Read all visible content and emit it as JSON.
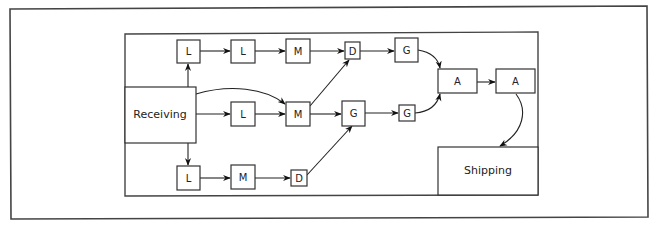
{
  "diagram": {
    "title": "",
    "nodes": [
      {
        "id": "receiving",
        "label": "Receiving"
      },
      {
        "id": "shipping",
        "label": "Shipping"
      },
      {
        "id": "l1",
        "label": "L"
      },
      {
        "id": "l2",
        "label": "L"
      },
      {
        "id": "m1",
        "label": "M"
      },
      {
        "id": "d1",
        "label": "D"
      },
      {
        "id": "g1",
        "label": "G"
      },
      {
        "id": "l3",
        "label": "L"
      },
      {
        "id": "m2",
        "label": "M"
      },
      {
        "id": "g2",
        "label": "G"
      },
      {
        "id": "g3",
        "label": "G"
      },
      {
        "id": "l4",
        "label": "L"
      },
      {
        "id": "m3",
        "label": "M"
      },
      {
        "id": "d2",
        "label": "D"
      },
      {
        "id": "a1",
        "label": "A"
      },
      {
        "id": "a2",
        "label": "A"
      }
    ],
    "edges": [
      {
        "from": "receiving",
        "to": "l1"
      },
      {
        "from": "l1",
        "to": "l2"
      },
      {
        "from": "l2",
        "to": "m1"
      },
      {
        "from": "m1",
        "to": "d1"
      },
      {
        "from": "d1",
        "to": "g1"
      },
      {
        "from": "g1",
        "to": "a1"
      },
      {
        "from": "receiving",
        "to": "m2"
      },
      {
        "from": "receiving",
        "to": "l3"
      },
      {
        "from": "l3",
        "to": "m2"
      },
      {
        "from": "m2",
        "to": "d1"
      },
      {
        "from": "m2",
        "to": "g2"
      },
      {
        "from": "g2",
        "to": "g3"
      },
      {
        "from": "g3",
        "to": "a1"
      },
      {
        "from": "receiving",
        "to": "l4"
      },
      {
        "from": "l4",
        "to": "m3"
      },
      {
        "from": "m3",
        "to": "d2"
      },
      {
        "from": "d2",
        "to": "g2"
      },
      {
        "from": "a1",
        "to": "a2"
      },
      {
        "from": "a2",
        "to": "shipping"
      }
    ]
  }
}
